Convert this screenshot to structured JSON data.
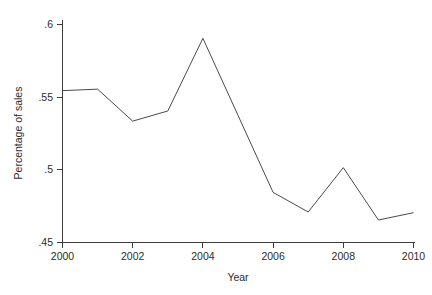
{
  "chart_data": {
    "type": "line",
    "title": "",
    "subtitle": "",
    "xlabel": "Year",
    "ylabel": "Percentage of sales",
    "x": [
      2000,
      2001,
      2002,
      2003,
      2004,
      2005,
      2006,
      2007,
      2008,
      2009,
      2010
    ],
    "values": [
      0.5545,
      0.5555,
      0.5335,
      0.5405,
      0.5905,
      0.5375,
      0.4845,
      0.471,
      0.5015,
      0.4655,
      0.4705
    ],
    "series": [
      {
        "name": "Percentage of sales",
        "values": [
          0.5545,
          0.5555,
          0.5335,
          0.5405,
          0.5905,
          0.5375,
          0.4845,
          0.471,
          0.5015,
          0.4655,
          0.4705
        ]
      }
    ],
    "xlim": [
      2000,
      2010
    ],
    "ylim": [
      0.45,
      0.6
    ],
    "xticks": [
      2000,
      2002,
      2004,
      2006,
      2008,
      2010
    ],
    "xtick_labels": [
      "2000",
      "2002",
      "2004",
      "2006",
      "2008",
      "2010"
    ],
    "yticks": [
      0.45,
      0.5,
      0.55,
      0.6
    ],
    "ytick_labels": [
      ".45",
      ".5",
      ".55",
      ".6"
    ],
    "grid": false,
    "legend": false,
    "legend_position": "none",
    "line_color": "#4a4a4a",
    "axis_color": "#3d3d3d",
    "background_color": "#ffffff"
  },
  "axes": {
    "y_tick_0": ".45",
    "y_tick_1": ".5",
    "y_tick_2": ".55",
    "y_tick_3": ".6",
    "x_tick_0": "2000",
    "x_tick_1": "2002",
    "x_tick_2": "2004",
    "x_tick_3": "2006",
    "x_tick_4": "2008",
    "x_tick_5": "2010",
    "x_title": "Year",
    "y_title": "Percentage of sales"
  }
}
